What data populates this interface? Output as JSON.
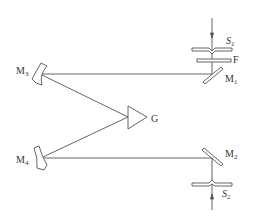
{
  "diagram": {
    "title": "",
    "colors": {
      "line": "#555555",
      "text": "#333333",
      "background": "#ffffff"
    },
    "labels": {
      "S1": {
        "base": "S",
        "sub": "1"
      },
      "F": {
        "base": "F"
      },
      "M1": {
        "base": "M",
        "sub": "1"
      },
      "M2": {
        "base": "M",
        "sub": "2"
      },
      "M3": {
        "base": "M",
        "sub": "3"
      },
      "M4": {
        "base": "M",
        "sub": "4"
      },
      "G": {
        "base": "G"
      },
      "S2": {
        "base": "S",
        "sub": "2"
      }
    },
    "components": [
      {
        "id": "S1",
        "type": "entrance-slit"
      },
      {
        "id": "F",
        "type": "filter"
      },
      {
        "id": "M1",
        "type": "plane-mirror"
      },
      {
        "id": "M3",
        "type": "concave-mirror"
      },
      {
        "id": "G",
        "type": "prism"
      },
      {
        "id": "M4",
        "type": "concave-mirror"
      },
      {
        "id": "M2",
        "type": "plane-mirror"
      },
      {
        "id": "S2",
        "type": "exit-slit"
      }
    ]
  }
}
